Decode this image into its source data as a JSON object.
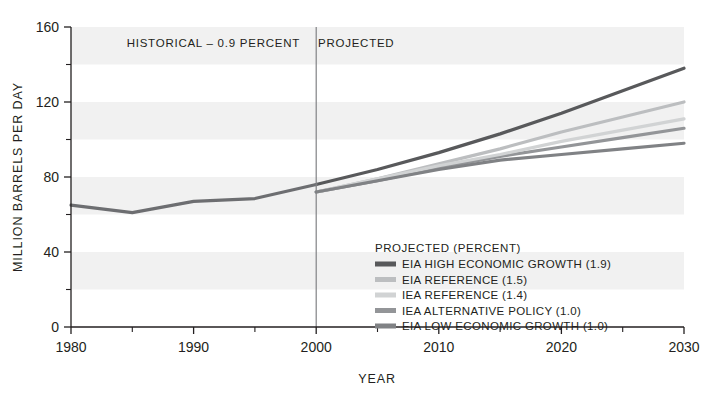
{
  "chart_data": {
    "type": "line",
    "title": "",
    "xlabel": "YEAR",
    "ylabel": "MILLION BARRELS PER DAY",
    "xlim": [
      1980,
      2030
    ],
    "ylim": [
      0,
      160
    ],
    "yticks": [
      0,
      40,
      80,
      120,
      160
    ],
    "yticks_minor": [
      20,
      60,
      100,
      140
    ],
    "xticks": [
      1980,
      1990,
      2000,
      2010,
      2020,
      2030
    ],
    "xticks_minor": [
      1985,
      1995,
      2005,
      2015,
      2025
    ],
    "grid": false,
    "bands": "alternating horizontal shading every 20 units",
    "legend_position": "inside-center-right",
    "legend_title": "PROJECTED (PERCENT)",
    "annotations": [
      {
        "text": "HISTORICAL – 0.9 PERCENT",
        "x": 1990,
        "y": 152
      },
      {
        "text": "PROJECTED",
        "x": 2003,
        "y": 152
      }
    ],
    "divider_year": 2000,
    "series": [
      {
        "name": "HISTORICAL",
        "color": "#6d6e71",
        "x": [
          1980,
          1985,
          1990,
          1995,
          2000
        ],
        "values": [
          65,
          61,
          67,
          68.5,
          76
        ]
      },
      {
        "name": "EIA HIGH ECONOMIC GROWTH (1.9)",
        "color": "#58595b",
        "x": [
          2000,
          2005,
          2010,
          2015,
          2020,
          2025,
          2030
        ],
        "values": [
          76,
          84,
          93,
          103,
          114,
          126,
          138
        ]
      },
      {
        "name": "EIA REFERENCE (1.5)",
        "color": "#bcbec0",
        "x": [
          2000,
          2005,
          2010,
          2015,
          2020,
          2025,
          2030
        ],
        "values": [
          72,
          79,
          87,
          95,
          104,
          112,
          120
        ]
      },
      {
        "name": "IEA REFERENCE (1.4)",
        "color": "#d1d3d4",
        "x": [
          2000,
          2005,
          2010,
          2015,
          2020,
          2025,
          2030
        ],
        "values": [
          72,
          79,
          86,
          92,
          99,
          105,
          111
        ]
      },
      {
        "name": "IEA ALTERNATIVE POLICY (1.0)",
        "color": "#939598",
        "x": [
          2000,
          2005,
          2010,
          2015,
          2020,
          2025,
          2030
        ],
        "values": [
          72,
          78,
          85,
          91,
          96,
          101,
          106
        ]
      },
      {
        "name": "EIA LOW ECONOMIC GROWTH (1.0)",
        "color": "#808285",
        "x": [
          2000,
          2005,
          2010,
          2015,
          2020,
          2025,
          2030
        ],
        "values": [
          72,
          78,
          84,
          89,
          92,
          95,
          98
        ]
      }
    ],
    "legend_items": [
      {
        "label": "EIA HIGH ECONOMIC GROWTH (1.9)",
        "color": "#58595b"
      },
      {
        "label": "EIA REFERENCE (1.5)",
        "color": "#bcbec0"
      },
      {
        "label": "IEA REFERENCE (1.4)",
        "color": "#d1d3d4"
      },
      {
        "label": "IEA ALTERNATIVE POLICY (1.0)",
        "color": "#939598"
      },
      {
        "label": "EIA LOW ECONOMIC GROWTH (1.0)",
        "color": "#808285"
      }
    ]
  },
  "axis": {
    "y_label": "MILLION BARRELS PER DAY",
    "x_label": "YEAR",
    "y_tick_labels": [
      "160",
      "120",
      "80",
      "40",
      "0"
    ],
    "x_tick_labels": [
      "1980",
      "1990",
      "2000",
      "2010",
      "2020",
      "2030"
    ]
  },
  "annotations": {
    "historical": "HISTORICAL – 0.9 PERCENT",
    "projected": "PROJECTED"
  },
  "legend": {
    "title": "PROJECTED (PERCENT)",
    "items": [
      "EIA HIGH ECONOMIC GROWTH (1.9)",
      "EIA REFERENCE (1.5)",
      "IEA REFERENCE (1.4)",
      "IEA ALTERNATIVE POLICY (1.0)",
      "EIA LOW ECONOMIC GROWTH (1.0)"
    ]
  },
  "colors": {
    "band": "#f1f1f1",
    "axis": "#231f20",
    "divider": "#808285"
  }
}
